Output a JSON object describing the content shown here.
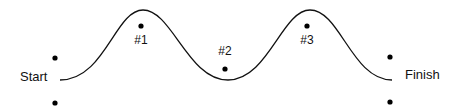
{
  "diagram": {
    "colors": {
      "stroke": "#111111",
      "dot": "#000000",
      "text": "#111111",
      "background": "#ffffff"
    },
    "path": {
      "d": "M 60 80 C 105 80, 115 10, 143 10 C 172 10, 188 80, 228 80 C 268 80, 282 10, 310 10 C 340 10, 352 80, 392 80"
    },
    "labels": {
      "start": "Start",
      "finish": "Finish",
      "checkpoint1": "#1",
      "checkpoint2": "#2",
      "checkpoint3": "#3"
    },
    "dots": [
      {
        "name": "start-top-dot",
        "cx": 55,
        "cy": 58
      },
      {
        "name": "start-bottom-dot",
        "cx": 55,
        "cy": 103
      },
      {
        "name": "checkpoint-1-dot",
        "cx": 141,
        "cy": 26
      },
      {
        "name": "checkpoint-2-dot",
        "cx": 225,
        "cy": 69
      },
      {
        "name": "checkpoint-3-dot",
        "cx": 307,
        "cy": 26
      },
      {
        "name": "finish-top-dot",
        "cx": 390,
        "cy": 57
      },
      {
        "name": "finish-bottom-dot",
        "cx": 390,
        "cy": 102
      }
    ]
  }
}
